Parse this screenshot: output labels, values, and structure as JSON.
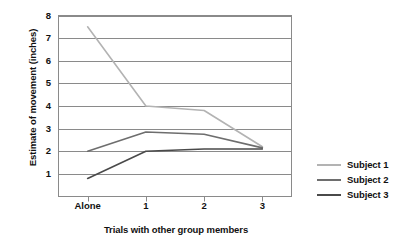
{
  "chart_data": {
    "type": "line",
    "title": "",
    "xlabel": "Trials with other group members",
    "ylabel": "Estimate of movement (inches)",
    "categories": [
      "Alone",
      "1",
      "2",
      "3"
    ],
    "ylim": [
      0,
      8
    ],
    "ytick_labels": [
      "1",
      "2",
      "3",
      "4",
      "5",
      "6",
      "7",
      "8"
    ],
    "ytick_values": [
      1,
      2,
      3,
      4,
      5,
      6,
      7,
      8
    ],
    "grid": "horizontal",
    "legend_position": "right",
    "series": [
      {
        "name": "Subject 1",
        "color": "#b3b3b3",
        "values": [
          7.5,
          4.0,
          3.8,
          2.2
        ]
      },
      {
        "name": "Subject 2",
        "color": "#6e6e6e",
        "values": [
          2.0,
          2.85,
          2.75,
          2.15
        ]
      },
      {
        "name": "Subject 3",
        "color": "#4a4a4a",
        "values": [
          0.8,
          2.0,
          2.1,
          2.1
        ]
      }
    ]
  },
  "plot": {
    "axis_color": "#8a8a8a",
    "grid_color": "#8a8a8a",
    "background": "#ffffff"
  }
}
